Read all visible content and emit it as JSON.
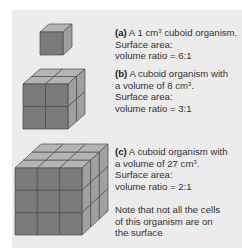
{
  "figure": {
    "colors": {
      "background": "#ececec",
      "front_face": "#7a7a7a",
      "top_face": "#b4b4b4",
      "side_face": "#a0a0a0",
      "edge": "#4a4a4a"
    },
    "items": [
      {
        "label": "(a)",
        "text_before_sup": " A 1 cm",
        "sup": "3",
        "text_after_sup": " cuboid organism.",
        "line2": "Surface area:",
        "line3": "volume ratio = 6:1",
        "cube_size": 1
      },
      {
        "label": "(b)",
        "text_line1": " A cuboid organism with",
        "text_before_sup": "a volume of 8 cm",
        "sup": "3",
        "text_after_sup": ".",
        "line3": "Surface area:",
        "line4": "volume ratio = 3:1",
        "cube_size": 2
      },
      {
        "label": "(c)",
        "text_line1": " A cuboid organism with",
        "text_before_sup": "a volume of 27 cm",
        "sup": "3",
        "text_after_sup": ".",
        "line3": "Surface area:",
        "line4": "volume ratio = 2:1",
        "cube_size": 3
      }
    ],
    "note": [
      "Note that not all the cells",
      "of this organism are on",
      "the surface"
    ]
  }
}
